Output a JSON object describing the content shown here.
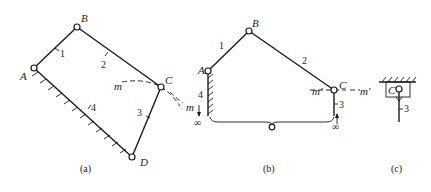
{
  "figure": {
    "panels": [
      {
        "id": "a",
        "caption": "(a)",
        "joints": {
          "A": "A",
          "B": "B",
          "C": "C",
          "D": "D"
        },
        "links": {
          "l1": "1",
          "l2": "2",
          "l3": "3",
          "l4": "4"
        },
        "trajectory_label": "m"
      },
      {
        "id": "b",
        "caption": "(b)",
        "joints": {
          "A": "A",
          "B": "B",
          "C": "C"
        },
        "links": {
          "l1": "1",
          "l2": "2",
          "l3": "3",
          "l4": "4"
        },
        "trajectory_labels": {
          "m": "m",
          "m_prime": "m′"
        },
        "infinity_left": "∞",
        "infinity_right": "∞"
      },
      {
        "id": "c",
        "caption": "(c)",
        "joints": {
          "C": "C"
        },
        "links": {
          "l3": "3"
        }
      }
    ]
  }
}
